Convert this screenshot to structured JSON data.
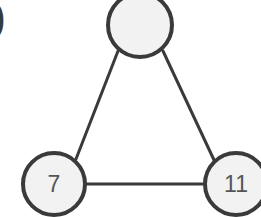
{
  "figure": {
    "background_color": "#ffffff",
    "node_fill": "#f2f2f2",
    "node_stroke": "#3a3a3a",
    "edge_color": "#3a3a3a",
    "label_color": "#555555",
    "node_stroke_width": 4,
    "edge_width": 3
  },
  "stray_marks": {
    "left_paren_glyph": ")"
  },
  "graph_data": {
    "type": "diagram",
    "layout": "triangle",
    "nodes": [
      {
        "id": "top",
        "label": "",
        "cx": 140,
        "cy": 25,
        "r": 32,
        "clipped": "top"
      },
      {
        "id": "left",
        "label": "7",
        "cx": 54,
        "cy": 184,
        "r": 31,
        "clipped": "bottom"
      },
      {
        "id": "right",
        "label": "11",
        "cx": 236,
        "cy": 184,
        "r": 31,
        "clipped": "right"
      }
    ],
    "edges": [
      {
        "from": "top",
        "to": "left"
      },
      {
        "from": "top",
        "to": "right"
      },
      {
        "from": "left",
        "to": "right"
      }
    ]
  }
}
